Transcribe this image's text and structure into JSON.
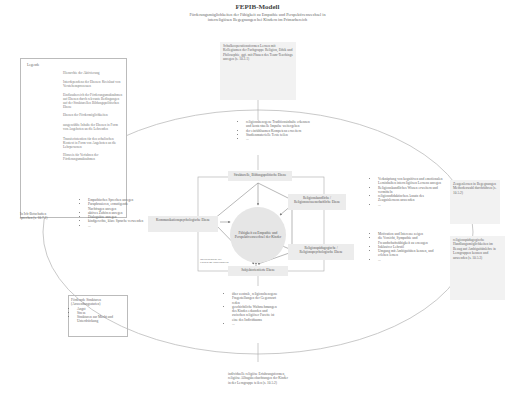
{
  "header": {
    "title": "FEPIB-Modell",
    "subtitle_line1": "Förderungsmöglichkeiten der Fähigkeit zu Empathie und Perspektivenwechsel in",
    "subtitle_line2": "interreligiösen Begegnungen bei Kindern im Primarbereich"
  },
  "legend": {
    "title": "Legende",
    "items": [
      {
        "symbol": "arrow",
        "label": "Hierarchie der Aktivierung"
      },
      {
        "symbol": "double-arrow",
        "label": "Interdependenz der Ebenen: Kreislauf von Verstehensprozessen"
      },
      {
        "symbol": "line",
        "label": "Einflussbereich der Förderungsmaßnahmen auf Ebenen durch relevante Bedingungen auf der Strukturellen Bildungspolitischen Ebene"
      },
      {
        "symbol": "shade",
        "label": "Ebenen der Fördermöglichkeiten"
      },
      {
        "symbol": "none",
        "label": "ausgewählte Inhalte der Ebenen in Form von Angeboten an die Lehrenden"
      },
      {
        "symbol": "shade-light",
        "label": "Transferintention für den schulischen Kontext in Form von Angeboten an die Lehrpersonen"
      },
      {
        "symbol": "none",
        "label": "Hinweis für Verfahren der Förderungsmaßnahmen"
      }
    ]
  },
  "levels": {
    "top": "Strukturelle, Bildungspolitische Ebene",
    "upper_right": "Religionskundliche / Religionswissenschaftliche Ebene",
    "lower_right": "Religionspädagogische / Religionspsychologische Ebene",
    "bottom": "Subjektorientierte Ebene",
    "left": "Kommunikationspsychologische Ebene",
    "inner_note": "Interdependenz der Ebenen im Förderprozess",
    "center": "Fähigkeit zu Empathie und Perspektivenwechsel der Kinder"
  },
  "boxes": {
    "top_offer": "Schulkooperationsformen Lernen mit Kollegiumen der Fachgruppe Religion, Ethik und Philosophie, ggf. mit Phasen des Team-Teachings anregen (s. 10.3.1)",
    "top_list": [
      "religionsbezogene Traditionsinhalte erkennen und kontextuelle Impulse weitergeben",
      "der einfühlsamen Kompetenz erweitern",
      "Studienmaterielle Texte teilen",
      "..."
    ],
    "right_top_list": [
      "Verknüpfung von kognitiven und emotionalen Lerninhalten interreligiösen Lernens anregen",
      "Religionskundliches Wissen erweitern und vermitteln",
      "religionsdidaktischen Ansatz des Zeugnislernens anwenden",
      "..."
    ],
    "right_top_offer": "Zeugenlernen in Begegnungen Methodenwahl durchführen (s. 10.5.2)",
    "right_bottom_list": [
      "Motivation und Interesse zeigen",
      "die Vorsicht, Sympathie und Freundschaftsfähigkeit zu erzeugen",
      "Inklusiver Lehrstil",
      "Umgang mit Ambiguitäten kennen, und erleben lernen",
      "..."
    ],
    "right_bottom_offer": "religionspädagogische Handlungsmöglichkeiten im Bezug auf Ambiguitätslehre in Lerngruppen kennen und anwenden (s. 10.5.3)",
    "left_offer": "In Ich-Botschaften sprechen (s. 10.7.1)",
    "left_list": [
      "Empathisches Sprechen anregen",
      "Paraphrasieren, ermutigende Nachfragen anregen",
      "aktives Zuhören anregen",
      "Dialogsätze anregen",
      "kindgerechte, klare Sprache verwenden",
      "..."
    ],
    "left_note": "Fördernde Strukturen (Anwendungsstufen)",
    "left_note_items": [
      "Angst",
      "Stress",
      "Strukturen zur Macht und Unterdrückung"
    ],
    "bottom_list": [
      "über zentrale, religionsbezogene Fragestellungen der Gegenwart reden",
      "geschichtliche Wahrnehmungen des Kindes erkunden und zwischen religiöser Facette ist eine des Individuums",
      "..."
    ],
    "bottom_offer": "individuelle religiöse Erfahrungsformen, religiöse Alltagsbeobachtungen der Kinder in der Lerngruppe teilen (s. 10.5.2)"
  }
}
